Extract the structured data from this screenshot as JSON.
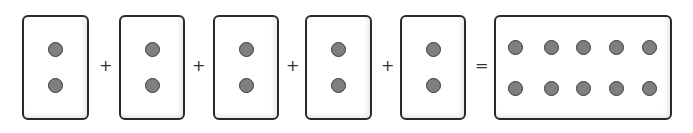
{
  "diagram": {
    "title": "",
    "colors": {
      "dot_fill": "#7f7f7f",
      "dot_stroke": "#3a3a3a",
      "card_border": "#2a2a2a",
      "background": "#ffffff"
    },
    "addends": [
      {
        "dots": 2
      },
      {
        "dots": 2
      },
      {
        "dots": 2
      },
      {
        "dots": 2
      },
      {
        "dots": 2
      }
    ],
    "operators": {
      "plus": "+",
      "equals": "="
    },
    "result": {
      "dots": 10,
      "rows": 2,
      "columns": 5
    }
  }
}
